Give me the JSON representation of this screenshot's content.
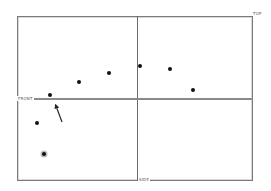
{
  "diagram": {
    "labels": {
      "top": "TOP",
      "front": "FRONT",
      "side": "SIDE"
    },
    "frame": {
      "x": 17,
      "y": 16,
      "width": 236,
      "height": 165
    },
    "dividers": {
      "vertical_x": 137,
      "horizontal_y": 99
    },
    "points": [
      {
        "x": 50,
        "y": 95
      },
      {
        "x": 79,
        "y": 82
      },
      {
        "x": 109,
        "y": 73
      },
      {
        "x": 140,
        "y": 66
      },
      {
        "x": 170,
        "y": 69
      },
      {
        "x": 193,
        "y": 90
      },
      {
        "x": 37,
        "y": 123
      },
      {
        "x": 44,
        "y": 154,
        "highlighted": true
      }
    ],
    "arrow": {
      "from": [
        62,
        122
      ],
      "to": [
        56,
        106
      ]
    },
    "colors": {
      "frame": "#7a7a7a",
      "point": "#111111",
      "highlight_ring": "#bdbdbd"
    }
  }
}
